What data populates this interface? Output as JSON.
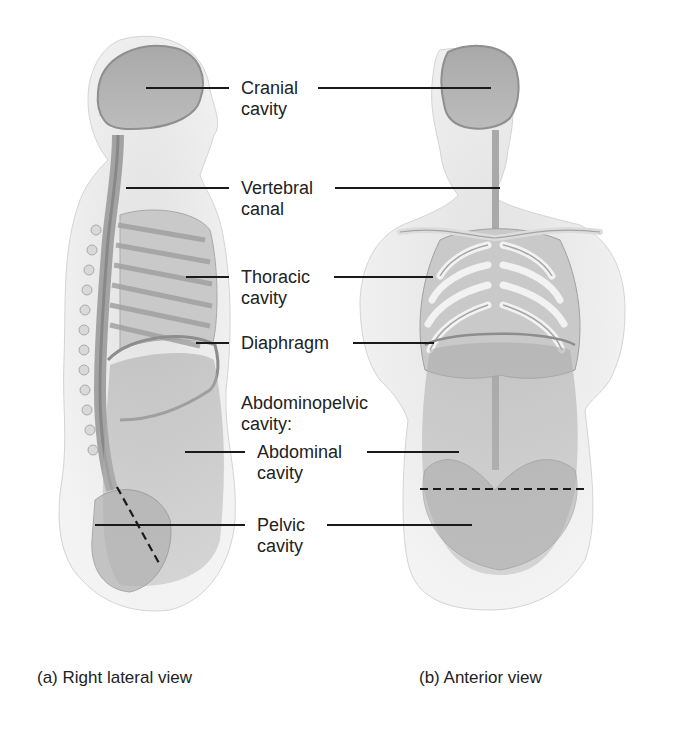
{
  "diagram": {
    "labels": [
      {
        "id": "cranial",
        "line1": "Cranial",
        "line2": "cavity"
      },
      {
        "id": "vertebral",
        "line1": "Vertebral",
        "line2": "canal"
      },
      {
        "id": "thoracic",
        "line1": "Thoracic",
        "line2": "cavity"
      },
      {
        "id": "diaphragm",
        "line1": "Diaphragm",
        "line2": ""
      },
      {
        "id": "abdominopelvic",
        "line1": "Abdominopelvic",
        "line2": "cavity:"
      },
      {
        "id": "abdominal",
        "line1": "Abdominal",
        "line2": "cavity"
      },
      {
        "id": "pelvic",
        "line1": "Pelvic",
        "line2": "cavity"
      }
    ],
    "captions": {
      "left": "(a) Right lateral view",
      "right": "(b) Anterior view"
    },
    "colors": {
      "body_fill": "#e6e6e6",
      "cavity_fill": "#b5b5b5",
      "bone_fill": "#f2f2f2",
      "leader_line": "#1a1a1a"
    }
  }
}
